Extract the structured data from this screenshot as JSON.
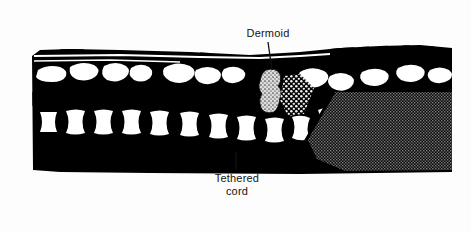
{
  "figure": {
    "kind": "medical-illustration",
    "frame": {
      "border_color": "#8c8c8c",
      "background_color": "#fefefe"
    },
    "palette": {
      "ink": "#000000",
      "paper": "#ffffff",
      "page": "#fdfdfd",
      "stipple_light": "#d8d8d8",
      "halftone_gray": "#3b3b3b",
      "label_color": "#131313"
    },
    "annotations": [
      {
        "id": "dermoid",
        "label": "Dermoid",
        "lines": [
          "Dermoid"
        ],
        "position": "top",
        "leader": {
          "from_x": 268,
          "from_y": 42,
          "to_x": 272,
          "to_y": 70
        }
      },
      {
        "id": "tethered-cord",
        "label": "Tethered cord",
        "lines": [
          "Tethered",
          "cord"
        ],
        "position": "bottom",
        "leader": {
          "from_x": 236,
          "from_y": 170,
          "to_x": 236,
          "to_y": 152
        }
      }
    ],
    "structures": [
      {
        "name": "posterior-elements-row",
        "appearance": "irregular white blobs on black, upper band"
      },
      {
        "name": "vertebral-bodies-row",
        "appearance": "white hourglass shapes on black, lower band"
      },
      {
        "name": "dermoid-mass",
        "appearance": "light stippled vertical column"
      },
      {
        "name": "dermoid-tract",
        "appearance": "dotted diagonal band running down and to the right"
      },
      {
        "name": "sacral-mass",
        "appearance": "dense halftone gray block at lower right"
      }
    ]
  }
}
